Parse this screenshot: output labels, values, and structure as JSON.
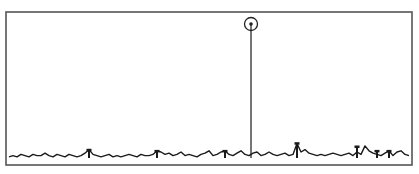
{
  "chart_data": {
    "type": "line",
    "title": "",
    "xlabel": "",
    "ylabel": "",
    "grid": false,
    "legend": null,
    "frame": {
      "x": 6,
      "y": 12,
      "width": 406,
      "height": 153
    },
    "baseline_y": 158,
    "xlim": [
      0,
      100
    ],
    "ylim": [
      0,
      100
    ],
    "colors": {
      "frame": "#555555",
      "trace": "#1a1a1a",
      "marker": "#222222",
      "background": "#ffffff"
    },
    "series": [
      {
        "name": "signal",
        "x": [
          0,
          1,
          2,
          3,
          4,
          5,
          6,
          7,
          8,
          9,
          10,
          11,
          12,
          13,
          14,
          15,
          16,
          17,
          18,
          19,
          20,
          21,
          22,
          23,
          24,
          25,
          26,
          27,
          28,
          29,
          30,
          31,
          32,
          33,
          34,
          35,
          36,
          37,
          38,
          39,
          40,
          41,
          42,
          43,
          44,
          45,
          46,
          47,
          48,
          49,
          50,
          51,
          52,
          53,
          54,
          55,
          56,
          57,
          58,
          59,
          60,
          61,
          62,
          63,
          64,
          65,
          66,
          67,
          68,
          69,
          70,
          71,
          72,
          73,
          74,
          75,
          76,
          77,
          78,
          79,
          80,
          81,
          82,
          83,
          84,
          85,
          86,
          87,
          88,
          89,
          90,
          91,
          92,
          93,
          94,
          95,
          96,
          97,
          98,
          99,
          100
        ],
        "values": [
          1,
          2,
          1,
          3,
          2,
          1,
          3,
          2,
          2,
          4,
          2,
          1,
          3,
          2,
          1,
          3,
          2,
          1,
          2,
          4,
          7,
          3,
          2,
          1,
          2,
          3,
          1,
          2,
          1,
          2,
          3,
          2,
          1,
          3,
          2,
          2,
          3,
          6,
          5,
          3,
          4,
          2,
          3,
          5,
          2,
          3,
          2,
          1,
          3,
          4,
          6,
          2,
          3,
          5,
          6,
          3,
          2,
          4,
          6,
          3,
          2,
          4,
          5,
          2,
          3,
          5,
          3,
          2,
          3,
          4,
          2,
          3,
          12,
          5,
          7,
          4,
          3,
          2,
          3,
          2,
          3,
          4,
          3,
          2,
          3,
          4,
          2,
          5,
          3,
          10,
          6,
          4,
          3,
          2,
          4,
          6,
          2,
          5,
          6,
          3,
          2
        ]
      }
    ],
    "peak": {
      "x": 60.5,
      "value": 100,
      "marker": "circled-dot"
    },
    "secondary_peaks": [
      {
        "x": 20,
        "value": 7
      },
      {
        "x": 37,
        "value": 6
      },
      {
        "x": 54,
        "value": 6
      },
      {
        "x": 72,
        "value": 13
      },
      {
        "x": 87,
        "value": 10
      },
      {
        "x": 92,
        "value": 6
      },
      {
        "x": 95,
        "value": 6
      }
    ]
  }
}
